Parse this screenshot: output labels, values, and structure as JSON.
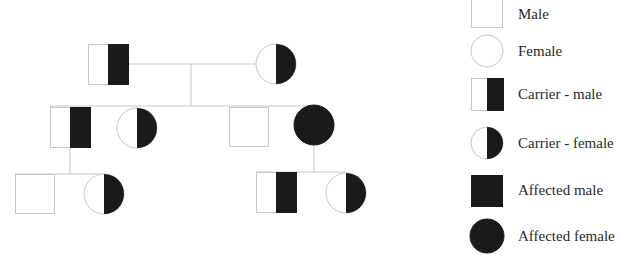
{
  "diagram": {
    "type": "pedigree",
    "colors": {
      "line": "#c8c8c8",
      "fill": "#1a1a1a",
      "background": "#ffffff"
    },
    "generations": [
      {
        "id": "I",
        "individuals": [
          {
            "id": "I-1",
            "sex": "male",
            "status": "carrier"
          },
          {
            "id": "I-2",
            "sex": "female",
            "status": "carrier"
          }
        ]
      },
      {
        "id": "II",
        "individuals": [
          {
            "id": "II-1",
            "sex": "male",
            "status": "carrier"
          },
          {
            "id": "II-2",
            "sex": "female",
            "status": "carrier"
          },
          {
            "id": "II-3",
            "sex": "male",
            "status": "unaffected"
          },
          {
            "id": "II-4",
            "sex": "female",
            "status": "affected"
          }
        ]
      },
      {
        "id": "III",
        "individuals": [
          {
            "id": "III-1",
            "sex": "male",
            "status": "unaffected",
            "parent": "II-1"
          },
          {
            "id": "III-2",
            "sex": "female",
            "status": "carrier",
            "parent": "II-1"
          },
          {
            "id": "III-3",
            "sex": "male",
            "status": "carrier",
            "parent": "II-4"
          },
          {
            "id": "III-4",
            "sex": "female",
            "status": "carrier",
            "parent": "II-4"
          }
        ]
      }
    ],
    "relations": [
      {
        "type": "mating",
        "from": "I-1",
        "to": "I-2"
      },
      {
        "type": "offspring",
        "parents": [
          "I-1",
          "I-2"
        ],
        "children": [
          "II-1",
          "II-2",
          "II-3",
          "II-4"
        ]
      },
      {
        "type": "offspring",
        "parents": [
          "II-1"
        ],
        "children": [
          "III-1",
          "III-2"
        ]
      },
      {
        "type": "offspring",
        "parents": [
          "II-4"
        ],
        "children": [
          "III-3",
          "III-4"
        ]
      }
    ]
  },
  "legend": {
    "items": [
      {
        "sex": "male",
        "status": "unaffected",
        "label": "Male"
      },
      {
        "sex": "female",
        "status": "unaffected",
        "label": "Female"
      },
      {
        "sex": "male",
        "status": "carrier",
        "label": "Carrier - male"
      },
      {
        "sex": "female",
        "status": "carrier",
        "label": "Carrier - female"
      },
      {
        "sex": "male",
        "status": "affected",
        "label": "Affected male"
      },
      {
        "sex": "female",
        "status": "affected",
        "label": "Affected female"
      }
    ]
  }
}
